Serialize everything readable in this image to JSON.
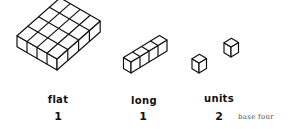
{
  "pieces": [
    {
      "name": "flat",
      "label": "flat",
      "count": "1"
    },
    {
      "name": "long",
      "label": "long",
      "count": "1"
    },
    {
      "name": "units",
      "label": "units",
      "count": "2"
    }
  ],
  "base_note": "base four"
}
